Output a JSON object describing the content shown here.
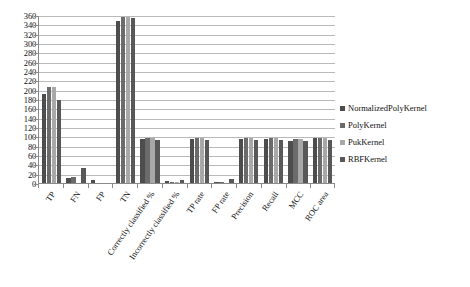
{
  "chart_data": {
    "type": "bar",
    "title": "",
    "xlabel": "",
    "ylabel": "",
    "ylim": [
      0,
      360
    ],
    "ytick_step": 20,
    "grid": true,
    "legend_position": "right",
    "categories": [
      "TP",
      "FN",
      "FP",
      "TN",
      "Correctly classified %",
      "Incorrectly classified %",
      "TP rate",
      "FP rate",
      "Precision",
      "Recall",
      "MCC",
      "ROC area"
    ],
    "y_ticks": [
      "0",
      "20",
      "40",
      "60",
      "80",
      "100",
      "120",
      "140",
      "160",
      "180",
      "200",
      "220",
      "240",
      "260",
      "280",
      "300",
      "320",
      "340",
      "360"
    ],
    "series": [
      {
        "name": "NormalizedPolyKernel",
        "color": "#4d4d4d",
        "values": [
          190,
          11,
          6,
          348,
          95,
          5,
          95,
          3,
          95,
          95,
          91,
          96
        ]
      },
      {
        "name": "PolyKernel",
        "color": "#6b6b6b",
        "values": [
          205,
          12,
          1,
          355,
          97,
          3,
          97,
          2,
          97,
          97,
          94,
          97
        ]
      },
      {
        "name": "PukKernel",
        "color": "#a8a8a8",
        "values": [
          205,
          1,
          1,
          355,
          97,
          3,
          97,
          1,
          97,
          97,
          94,
          97
        ]
      },
      {
        "name": "RBFKernel",
        "color": "#585858",
        "values": [
          178,
          32,
          1,
          354,
          93,
          7,
          93,
          8,
          93,
          93,
          90,
          93
        ]
      }
    ]
  },
  "legend": {
    "items": [
      {
        "label": "NormalizedPolyKernel",
        "color": "#4d4d4d"
      },
      {
        "label": "PolyKernel",
        "color": "#6b6b6b"
      },
      {
        "label": "PukKernel",
        "color": "#a8a8a8"
      },
      {
        "label": "RBFKernel",
        "color": "#585858"
      }
    ]
  }
}
